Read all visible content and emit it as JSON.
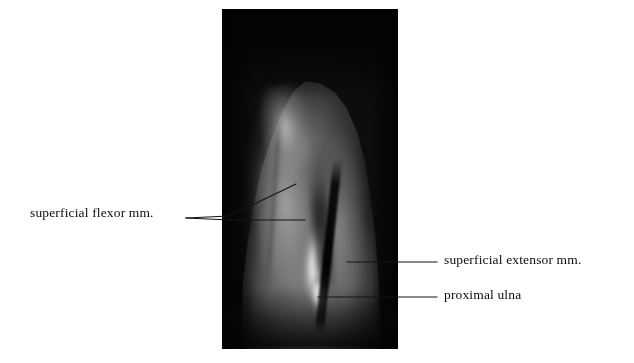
{
  "figure": {
    "type": "mri-sagittal-forearm",
    "background_color": "#ffffff",
    "panel": {
      "name": "mri-image-panel",
      "background_color": "#050505",
      "left": 222,
      "top": 9,
      "width": 176,
      "height": 340
    }
  },
  "labels": [
    {
      "id": "superficial-flexor",
      "text": "superficial  flexor mm.",
      "side": "left",
      "text_x": 30,
      "text_y": 205,
      "color": "#0c0c0c",
      "leaders": [
        {
          "from": [
            186,
            218
          ],
          "to": [
            228,
            216
          ],
          "then": [
            296,
            184
          ]
        },
        {
          "from": [
            186,
            218
          ],
          "to": [
            230,
            220
          ],
          "then": [
            305,
            220
          ]
        }
      ]
    },
    {
      "id": "superficial-extensor",
      "text": "superficial  extensor mm.",
      "side": "right",
      "text_x": 444,
      "text_y": 252,
      "color": "#0c0c0c",
      "leaders": [
        {
          "from": [
            437,
            262
          ],
          "to": [
            347,
            262
          ]
        }
      ]
    },
    {
      "id": "proximal-ulna",
      "text": "proximal ulna",
      "side": "right",
      "text_x": 444,
      "text_y": 287,
      "color": "#0c0c0c",
      "leaders": [
        {
          "from": [
            437,
            297
          ],
          "to": [
            318,
            297
          ]
        }
      ]
    }
  ],
  "anatomy_structures": [
    {
      "name": "superficial flexor mm.",
      "signal": "intermediate-bright",
      "location": "medial / left compartment"
    },
    {
      "name": "superficial extensor mm.",
      "signal": "intermediate",
      "location": "lateral / right compartment"
    },
    {
      "name": "proximal ulna",
      "signal": "very bright (marrow)",
      "location": "central-inferior"
    }
  ],
  "line_style": {
    "stroke": "#141414",
    "stroke_width": 1.15
  }
}
